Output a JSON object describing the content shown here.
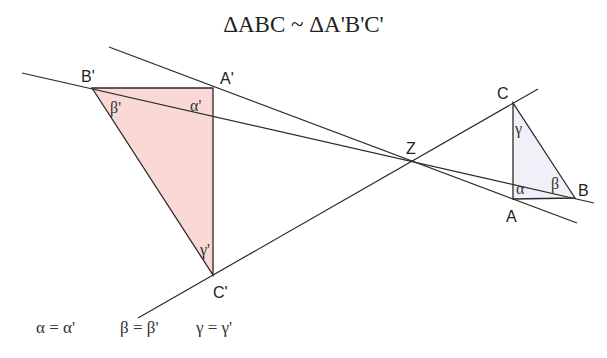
{
  "title": "ΔABC ~ ΔA'B'C'",
  "colors": {
    "line": "#2a2a2a",
    "large_triangle_fill": "#f9d8d6",
    "small_triangle_fill": "#f1f0f8"
  },
  "points": {
    "center": {
      "label": "Z",
      "x": 411,
      "y": 161
    },
    "A_prime": {
      "label": "A'",
      "x": 213,
      "y": 88
    },
    "B_prime": {
      "label": "B'",
      "x": 92,
      "y": 88
    },
    "C_prime": {
      "label": "C'",
      "x": 213,
      "y": 275
    },
    "A": {
      "label": "A",
      "x": 513,
      "y": 199
    },
    "B": {
      "label": "B",
      "x": 575,
      "y": 198
    },
    "C": {
      "label": "C",
      "x": 513,
      "y": 103
    }
  },
  "angles": {
    "alpha_prime": "α'",
    "beta_prime": "β'",
    "gamma_prime": "γ'",
    "alpha": "α",
    "beta": "β",
    "gamma": "γ"
  },
  "equalities": [
    "α = α'",
    "β = β'",
    "γ = γ'"
  ]
}
